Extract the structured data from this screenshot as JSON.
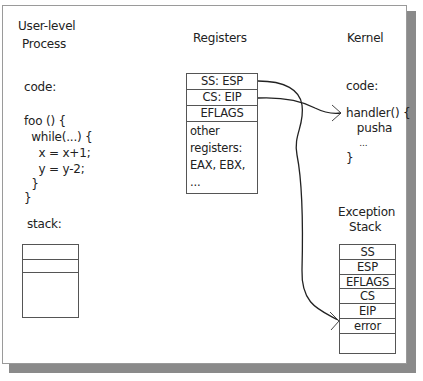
{
  "user_process": {
    "title_line1": "User-level",
    "title_line2": "Process",
    "code_label": "code:",
    "code_lines": [
      "foo () {",
      "  while(...) {",
      "    x = x+1;",
      "    y = y-2;",
      "  }",
      "}"
    ],
    "stack_label": "stack:",
    "stack_cells": [
      "",
      "",
      ""
    ]
  },
  "registers": {
    "title": "Registers",
    "cells": [
      "SS: ESP",
      "CS: EIP",
      "EFLAGS",
      "other\nregisters:\nEAX, EBX,\n..."
    ]
  },
  "kernel": {
    "title": "Kernel",
    "code_label": "code:",
    "code_lines": [
      "handler() {",
      "   pusha",
      "     ...",
      "}"
    ]
  },
  "exception_stack": {
    "title_line1": "Exception",
    "title_line2": "Stack",
    "cells": [
      "SS",
      "ESP",
      "EFLAGS",
      "CS",
      "EIP",
      "error",
      ""
    ]
  },
  "arrows": [
    {
      "from": "registers.SS:ESP",
      "to": "exception_stack.error"
    },
    {
      "from": "registers.CS:EIP",
      "to": "kernel.handler"
    }
  ]
}
